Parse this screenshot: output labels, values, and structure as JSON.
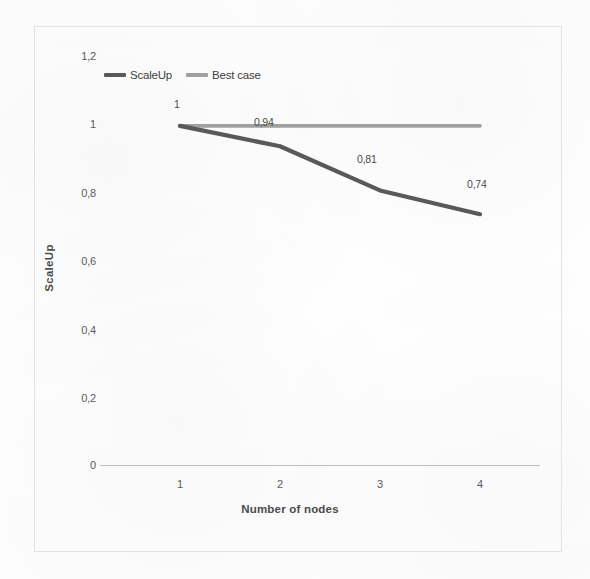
{
  "chart_data": {
    "type": "line",
    "title": "",
    "xlabel": "Number of nodes",
    "ylabel": "ScaleUp",
    "categories": [
      "1",
      "2",
      "3",
      "4"
    ],
    "xlim": [
      1,
      4
    ],
    "ylim": [
      0,
      1.2
    ],
    "grid": false,
    "legend_position": "top-left",
    "y_ticks": [
      "1,2",
      "1",
      "0,8",
      "0,6",
      "0,4",
      "0,2",
      "0"
    ],
    "y_tick_values": [
      1.2,
      1.0,
      0.8,
      0.6,
      0.4,
      0.2,
      0
    ],
    "series": [
      {
        "name": "ScaleUp",
        "color": "#595959",
        "values": [
          1.0,
          0.94,
          0.81,
          0.74
        ],
        "data_labels": [
          "1",
          "0,94",
          "0,81",
          "0,74"
        ]
      },
      {
        "name": "Best case",
        "color": "#a0a0a0",
        "values": [
          1.0,
          1.0,
          1.0,
          1.0
        ],
        "data_labels": [
          "",
          "",
          "",
          ""
        ]
      }
    ]
  },
  "legend": {
    "items": [
      {
        "label": "ScaleUp",
        "color": "#595959"
      },
      {
        "label": "Best case",
        "color": "#a0a0a0"
      }
    ]
  },
  "axes": {
    "y_title": "ScaleUp",
    "x_title": "Number of nodes",
    "y_labels": {
      "t0": "1,2",
      "t1": "1",
      "t2": "0,8",
      "t3": "0,6",
      "t4": "0,4",
      "t5": "0,2",
      "t6": "0"
    },
    "x_labels": {
      "c0": "1",
      "c1": "2",
      "c2": "3",
      "c3": "4"
    }
  },
  "data_labels": {
    "p0": "1",
    "p1": "0,94",
    "p2": "0,81",
    "p3": "0,74"
  },
  "colors": {
    "scaleup_line": "#595959",
    "bestcase_line": "#a0a0a0",
    "axis_line": "#bdbdbd",
    "frame_border": "#e3e3e3",
    "text": "#4a4a4a"
  }
}
